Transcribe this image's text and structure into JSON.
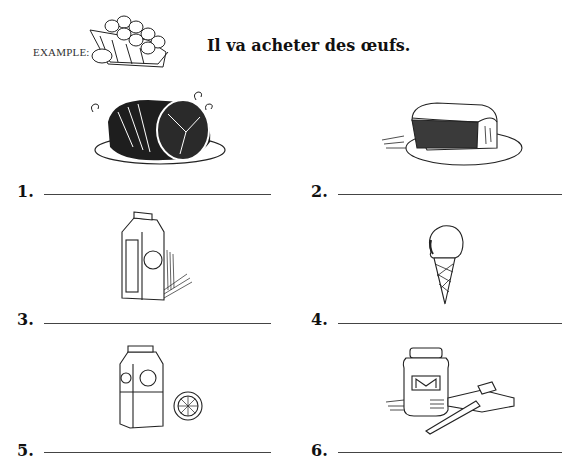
{
  "example": {
    "label": "EXAMPLE:",
    "image": "egg-carton-icon",
    "sentence": "Il va acheter des œufs."
  },
  "items": [
    {
      "number": "1.",
      "image": "ham-roast-icon",
      "answer": ""
    },
    {
      "number": "2.",
      "image": "bread-loaf-icon",
      "answer": ""
    },
    {
      "number": "3.",
      "image": "milk-carton-icon",
      "answer": ""
    },
    {
      "number": "4.",
      "image": "ice-cream-cone-icon",
      "answer": ""
    },
    {
      "number": "5.",
      "image": "orange-juice-carton-icon",
      "answer": ""
    },
    {
      "number": "6.",
      "image": "jam-jar-with-toast-icon",
      "answer": ""
    }
  ]
}
